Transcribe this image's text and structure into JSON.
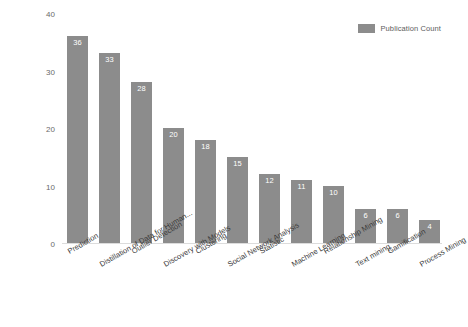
{
  "chart_data": {
    "type": "bar",
    "title": "",
    "subtitle": "",
    "xlabel": "",
    "ylabel": "",
    "ylim": [
      0,
      40
    ],
    "yticks": [
      0,
      10,
      20,
      30,
      40
    ],
    "grid": false,
    "legend_position": "top-right",
    "orientation": "vertical",
    "bar_color": "#8c8c8c",
    "value_label_color": "#ffffff",
    "categories": [
      "Prediction",
      "Distillation of Data for Human...",
      "Outlier Detection",
      "Discovery with Models",
      "Clustering",
      "Social Network Analysis",
      "Statistic",
      "Machine Learning",
      "Relationship Mining",
      "Text mining",
      "Gamification",
      "Process Mining"
    ],
    "series": [
      {
        "name": "Publication Count",
        "values": [
          36,
          33,
          28,
          20,
          18,
          15,
          12,
          11,
          10,
          6,
          6,
          4
        ]
      }
    ],
    "data_labels": [
      "36",
      "33",
      "28",
      "20",
      "18",
      "15",
      "12",
      "11",
      "10",
      "6",
      "6",
      "4"
    ]
  },
  "legend": {
    "entries": [
      {
        "label": "Publication Count",
        "color": "#8c8c8c",
        "swatch_icon": "legend-swatch-icon"
      }
    ]
  },
  "axis": {
    "y_tick_labels": [
      "40",
      "30",
      "20",
      "10",
      "0"
    ]
  }
}
